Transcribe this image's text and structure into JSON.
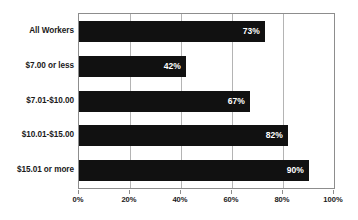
{
  "chart_data": {
    "type": "bar",
    "orientation": "horizontal",
    "title": "",
    "xlabel": "",
    "ylabel": "",
    "categories": [
      "All Workers",
      "$7.00 or less",
      "$7.01-$10.00",
      "$10.01-$15.00",
      "$15.01 or more"
    ],
    "values": [
      73,
      42,
      67,
      82,
      90
    ],
    "value_labels": [
      "73%",
      "42%",
      "67%",
      "82%",
      "90%"
    ],
    "xlim": [
      0,
      100
    ],
    "xticks": [
      0,
      20,
      40,
      60,
      80,
      100
    ],
    "xtick_labels": [
      "0%",
      "20%",
      "40%",
      "60%",
      "80%",
      "100%"
    ],
    "grid": true,
    "grid_axis": "x",
    "legend": false,
    "bar_color": "#111111",
    "value_label_color": "#ffffff",
    "grid_color": "#b4b4b4",
    "border_color": "#8d8d8d",
    "background_color": "#ffffff"
  }
}
